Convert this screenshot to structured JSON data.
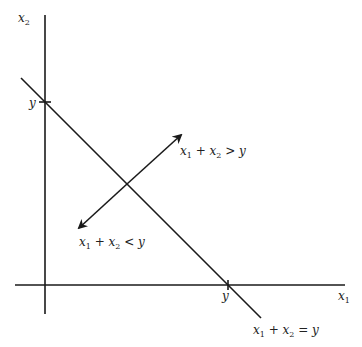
{
  "diagram": {
    "type": "budget-line / half-plane illustration",
    "axes": {
      "vertical": {
        "label": "x",
        "label_sub": "2"
      },
      "horizontal": {
        "label": "x",
        "label_sub": "1"
      }
    },
    "intercepts": {
      "vertical": "y",
      "horizontal": "y"
    },
    "line": {
      "label_parts": [
        "x",
        "1",
        " + x",
        "2",
        " = y"
      ],
      "equation": "x1 + x2 = y"
    },
    "regions": {
      "above": {
        "label_parts": [
          "x",
          "1",
          " + x",
          "2",
          " > y"
        ],
        "inequality": "x1 + x2 > y"
      },
      "below": {
        "label_parts": [
          "x",
          "1",
          " + x",
          "2",
          " < y"
        ],
        "inequality": "x1 + x2 < y"
      }
    },
    "colors": {
      "ink": "#1a1a1a",
      "background": "#ffffff"
    }
  }
}
